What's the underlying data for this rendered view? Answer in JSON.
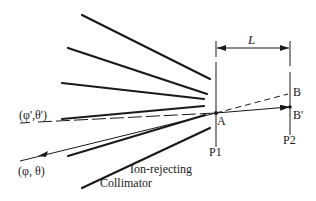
{
  "diagram": {
    "type": "ion-rejecting collimator beam geometry",
    "labels": {
      "distance": "L",
      "point_a": "A",
      "point_b": "B",
      "point_b_prime": "B'",
      "plane_1": "P1",
      "plane_2": "P2",
      "incident_angle": "(φ, θ)",
      "deflected_angle": "(φ',θ')",
      "collimator_line1": "Ion-rejecting",
      "collimator_line2": "Collimator"
    },
    "colors": {
      "ink": "#1a1a1a",
      "background": "#ffffff"
    },
    "collimator_plates": [
      {
        "x1": 82,
        "y1": 15,
        "x2": 210,
        "y2": 79
      },
      {
        "x1": 68,
        "y1": 48,
        "x2": 207,
        "y2": 94
      },
      {
        "x1": 62,
        "y1": 83,
        "x2": 204,
        "y2": 99
      },
      {
        "x1": 62,
        "y1": 119,
        "x2": 204,
        "y2": 106
      },
      {
        "x1": 68,
        "y1": 155,
        "x2": 204,
        "y2": 117
      },
      {
        "x1": 82,
        "y1": 188,
        "x2": 210,
        "y2": 128
      }
    ]
  }
}
